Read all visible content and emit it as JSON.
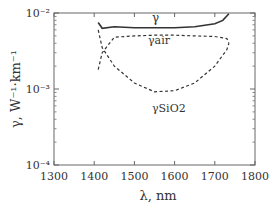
{
  "chart_data": {
    "type": "line",
    "title": "",
    "xlabel": "λ, nm",
    "ylabel": "γ, W⁻¹·km⁻¹",
    "xlim": [
      1300,
      1800
    ],
    "ylim": [
      0.0001,
      0.01
    ],
    "yscale": "log",
    "grid": false,
    "x_ticks": [
      "1300",
      "1400",
      "1500",
      "1600",
      "1700",
      "1800"
    ],
    "y_ticks": [
      "10⁻⁴",
      "10⁻³",
      "10⁻²"
    ],
    "series": [
      {
        "name": "γ",
        "style": "solid",
        "x": [
          1410,
          1420,
          1450,
          1500,
          1550,
          1600,
          1650,
          1700,
          1720,
          1735
        ],
        "y": [
          0.0075,
          0.0063,
          0.0066,
          0.0064,
          0.0064,
          0.0064,
          0.0066,
          0.0072,
          0.008,
          0.0098
        ]
      },
      {
        "name": "γair",
        "style": "dashed",
        "x": [
          1410,
          1420,
          1450,
          1500,
          1550,
          1600,
          1650,
          1700,
          1730,
          1735
        ],
        "y": [
          0.0018,
          0.003,
          0.0048,
          0.005,
          0.0051,
          0.0051,
          0.005,
          0.0049,
          0.0046,
          0.004
        ]
      },
      {
        "name": "γSiO2",
        "style": "dashed",
        "x": [
          1410,
          1420,
          1450,
          1500,
          1550,
          1600,
          1650,
          1700,
          1730,
          1735
        ],
        "y": [
          0.006,
          0.0035,
          0.002,
          0.0012,
          0.00092,
          0.00095,
          0.0012,
          0.002,
          0.0033,
          0.004
        ]
      }
    ],
    "annotations": [
      "γ",
      "γair",
      "γSiO2"
    ]
  }
}
